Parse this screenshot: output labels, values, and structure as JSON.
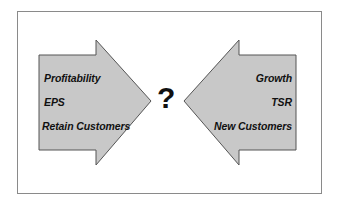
{
  "diagram": {
    "type": "opposing-arrows",
    "center_symbol": "?",
    "colors": {
      "arrow_fill": "#c8c8c8",
      "arrow_stroke": "#555555",
      "frame_border": "#8a8a8a",
      "text": "#111111"
    },
    "left_arrow": {
      "direction": "right",
      "items": [
        {
          "label": "Profitability"
        },
        {
          "label": "EPS"
        },
        {
          "label": "Retain Customers"
        }
      ]
    },
    "right_arrow": {
      "direction": "left",
      "items": [
        {
          "label": "Growth"
        },
        {
          "label": "TSR"
        },
        {
          "label": "New Customers"
        }
      ]
    }
  }
}
